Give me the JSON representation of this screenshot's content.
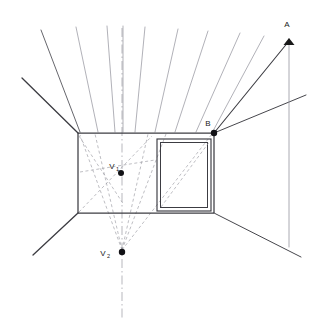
{
  "diagram": {
    "type": "perspective-construction-drawing",
    "title": "",
    "background_color": "#ffffff",
    "canvas": {
      "width": 328,
      "height": 325
    },
    "colors": {
      "solid_line": "#3c3c42",
      "strong_line": "#2a2a30",
      "light_ray": "#8f8f99",
      "dashed_construction": "#9a9aa2",
      "dashdot_axis": "#9a9aa2",
      "point_fill": "#111115",
      "label_text": "#1a1a1a"
    },
    "labels": [
      {
        "id": "label-a",
        "text": "A",
        "x": 287,
        "y": 27
      },
      {
        "id": "label-b",
        "text": "B",
        "x": 208,
        "y": 126
      },
      {
        "id": "label-v1",
        "text": "V",
        "sub": "1",
        "x": 113,
        "y": 166
      },
      {
        "id": "label-v2",
        "text": "V",
        "sub": "2",
        "x": 100,
        "y": 256
      }
    ],
    "points": [
      {
        "id": "point-a",
        "label": "A",
        "x": 289,
        "y": 40,
        "marker": "arrowhead",
        "radius": 2.2
      },
      {
        "id": "point-b",
        "label": "B",
        "x": 214,
        "y": 133,
        "marker": "dot",
        "radius": 3.2
      },
      {
        "id": "point-v1",
        "label": "V1",
        "x": 121,
        "y": 173,
        "marker": "dot",
        "radius": 3.0
      },
      {
        "id": "point-v2",
        "label": "V2",
        "x": 122,
        "y": 252,
        "marker": "dot",
        "radius": 3.2
      }
    ],
    "back_wall": {
      "id": "back-wall-rect",
      "top_left": {
        "x": 78,
        "y": 133
      },
      "top_right": {
        "x": 214,
        "y": 133
      },
      "bottom_right": {
        "x": 214,
        "y": 213
      },
      "bottom_left": {
        "x": 78,
        "y": 213
      }
    },
    "window_frame": {
      "id": "window-frame",
      "outer": {
        "x": 157,
        "y": 139,
        "width": 54,
        "height": 72
      },
      "inner": {
        "x": 160,
        "y": 142,
        "width": 48,
        "height": 66
      },
      "diagonal": {
        "x1": 160,
        "y1": 208,
        "x2": 210,
        "y2": 141
      }
    },
    "ceiling_rays": {
      "description": "rays from ceiling plane crossing the top wall edge, converging toward V2",
      "count": 9
    },
    "floor_lines": {
      "left": {
        "x1": 78,
        "y1": 213,
        "x2": 33,
        "y2": 255
      },
      "right": {
        "x1": 214,
        "y1": 213,
        "x2": 300,
        "y2": 257
      }
    },
    "corner_lines": {
      "top_left_out": {
        "x1": 78,
        "y1": 133,
        "x2": 22,
        "y2": 78
      },
      "top_right_out": {
        "x1": 214,
        "y1": 133,
        "x2": 305,
        "y2": 95
      }
    },
    "vertical_axis": {
      "id": "dash-dot-axis",
      "x": 122,
      "y_top": 28,
      "y_bottom": 318,
      "style": "dash-dot"
    },
    "ray_ab": {
      "x1": 214,
      "y1": 133,
      "x2": 289,
      "y2": 40
    },
    "vertical_a": {
      "x": 289,
      "y_top": 38,
      "y_bottom": 247
    }
  }
}
